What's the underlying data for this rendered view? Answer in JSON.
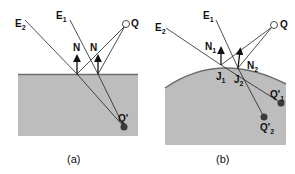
{
  "panels": [
    {
      "caption": "(a)",
      "labels": {
        "e1": "E",
        "e1_sub": "1",
        "e2": "E",
        "e2_sub": "2",
        "q": "Q",
        "n_left": "N",
        "n_right": "N",
        "q_prime": "Q'"
      }
    },
    {
      "caption": "(b)",
      "labels": {
        "e1": "E",
        "e1_sub": "1",
        "e2": "E",
        "e2_sub": "2",
        "q": "Q",
        "n1": "N",
        "n1_sub": "1",
        "n2": "N",
        "n2_sub": "2",
        "j1": "J",
        "j1_sub": "1",
        "j2": "J",
        "j2_sub": "2",
        "q1": "Q'",
        "q1_sub": "1",
        "q2": "Q'",
        "q2_sub": "2"
      }
    }
  ],
  "colors": {
    "surface": "#bdbdbd",
    "surface_edge": "#6e6e6e",
    "line": "#222222",
    "point": "#3a3a3a"
  }
}
